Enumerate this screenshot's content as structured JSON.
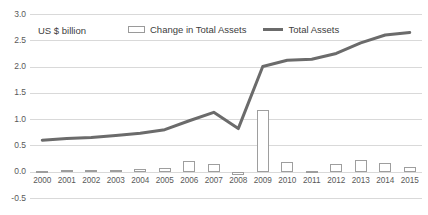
{
  "chart_data": {
    "type": "bar",
    "title": "",
    "subtitle": "",
    "xlabel": "",
    "ylabel": "US $ billion",
    "unit_note": "US $ billion",
    "ylim": [
      -0.5,
      3.0
    ],
    "ytick_step": 0.5,
    "grid": true,
    "legend_position": "top-center",
    "yticks": [
      "3.0",
      "2.5",
      "2.0",
      "1.5",
      "1.0",
      "0.5",
      "0.0",
      "-0.5"
    ],
    "ytick_values": [
      3.0,
      2.5,
      2.0,
      1.5,
      1.0,
      0.5,
      0.0,
      -0.5
    ],
    "categories": [
      "2000",
      "2001",
      "2002",
      "2003",
      "2004",
      "2005",
      "2006",
      "2007",
      "2008",
      "2009",
      "2010",
      "2011",
      "2012",
      "2013",
      "2014",
      "2015"
    ],
    "series": [
      {
        "name": "Change in Total Assets",
        "type": "bar",
        "color": "#ffffff",
        "border_color": "#9e9e9e",
        "values": [
          0.01,
          0.035,
          0.025,
          0.04,
          0.06,
          0.08,
          0.21,
          0.14,
          -0.055,
          1.17,
          0.19,
          0.02,
          0.14,
          0.22,
          0.17,
          0.09
        ]
      },
      {
        "name": "Total Assets",
        "type": "line",
        "color": "#6b6b6b",
        "values": [
          0.6,
          0.63,
          0.65,
          0.69,
          0.73,
          0.8,
          0.97,
          1.13,
          0.82,
          2.0,
          2.12,
          2.14,
          2.25,
          2.45,
          2.6,
          2.65
        ]
      }
    ]
  },
  "legend": {
    "bar_label": "Change in Total Assets",
    "line_label": "Total Assets"
  },
  "colors": {
    "line": "#6b6b6b",
    "bar_fill": "#ffffff",
    "bar_border": "#9e9e9e",
    "gridline": "#d9d9d9",
    "text": "#595959"
  }
}
